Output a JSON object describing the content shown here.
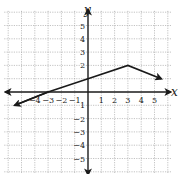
{
  "chart_data": {
    "type": "line",
    "title": "",
    "xlabel": "x",
    "ylabel": "y",
    "xlim": [
      -6,
      6
    ],
    "ylim": [
      -6,
      6
    ],
    "grid": true,
    "x_ticks": [
      -4,
      -3,
      -2,
      -1,
      1,
      2,
      3,
      4,
      5
    ],
    "y_ticks": [
      5,
      4,
      3,
      2,
      -2,
      -3,
      -4,
      -5
    ],
    "x_tick_labels": [
      "−4",
      "−3",
      "−2",
      "−1",
      "1",
      "2",
      "3",
      "4",
      "5"
    ],
    "y_tick_labels": [
      "5",
      "4",
      "3",
      "2",
      "−2",
      "−3",
      "−4",
      "−5"
    ],
    "y_tick_extra": {
      "value": -1,
      "label": "1"
    },
    "series": [
      {
        "name": "piecewise linear function",
        "points": [
          [
            -5.5,
            -1.0
          ],
          [
            -3,
            0
          ],
          [
            0,
            1
          ],
          [
            3,
            2
          ],
          [
            5.5,
            1.0
          ]
        ],
        "arrows": "both_ends"
      }
    ],
    "axis_arrows": true
  },
  "colors": {
    "grid": "#9a9a9a",
    "axis": "#1a1a1a",
    "line": "#1a1a1a",
    "text": "#222222"
  }
}
